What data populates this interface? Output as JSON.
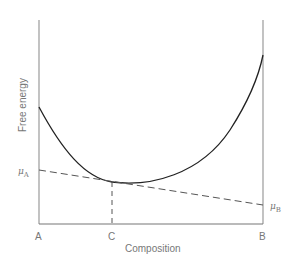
{
  "diagram": {
    "title": "",
    "y_axis_label": "Free energy",
    "x_axis_label": "Composition",
    "x_ticks": [
      {
        "label": "A",
        "position": "left"
      },
      {
        "label": "C",
        "position": "minimum"
      },
      {
        "label": "B",
        "position": "right"
      }
    ],
    "chemical_potentials": {
      "left": {
        "symbol": "μ",
        "subscript": "A"
      },
      "right": {
        "symbol": "μ",
        "subscript": "B"
      }
    },
    "curves": [
      {
        "name": "free-energy-curve",
        "style": "solid",
        "color": "#222222"
      },
      {
        "name": "tangent-line",
        "style": "dashed",
        "color": "#555555"
      },
      {
        "name": "composition-c-marker",
        "style": "dashed",
        "color": "#555555"
      }
    ],
    "colors": {
      "axis": "#888888",
      "curve": "#222222",
      "dashed": "#555555",
      "text": "#777777"
    }
  }
}
